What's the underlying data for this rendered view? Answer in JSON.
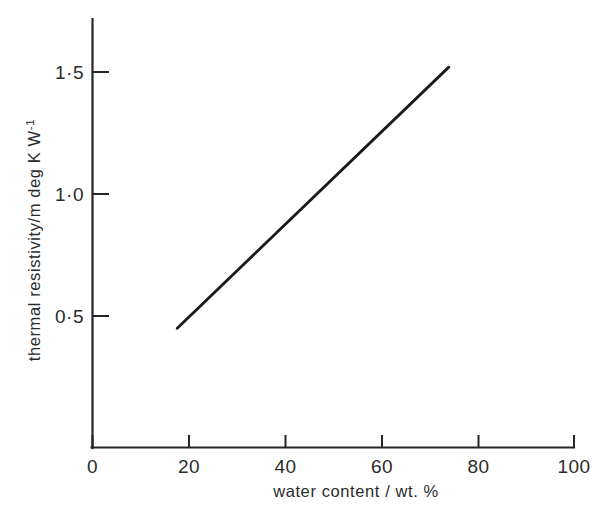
{
  "figure": {
    "background_color": "#ffffff",
    "ink_color": "#1a1a1a"
  },
  "chart_data": {
    "type": "line",
    "title": "",
    "subtitle": "",
    "xlabel": "water content / wt. %",
    "ylabel": "thermal resistivity/m deg K W",
    "ylabel_exponent": "-1",
    "xlim": [
      0,
      100
    ],
    "ylim": [
      0,
      1.6
    ],
    "x_ticks": [
      0,
      20,
      40,
      60,
      80,
      100
    ],
    "x_tick_labels": [
      "0",
      "20",
      "40",
      "60",
      "80",
      "100"
    ],
    "y_ticks": [
      0.5,
      1.0,
      1.5
    ],
    "y_tick_labels": [
      "0·5",
      "1·0",
      "1·5"
    ],
    "grid": false,
    "legend": null,
    "minor_ticks": false,
    "series": [
      {
        "name": "thermal resistivity vs water content",
        "style": "solid",
        "color": "#1a1a1a",
        "x": [
          17.6,
          74.0
        ],
        "y": [
          0.45,
          1.52
        ]
      }
    ],
    "annotations": []
  },
  "axis_labels": {
    "x_title": "water content / wt. %",
    "y_title_main": "thermal resistivity/m deg K  W",
    "y_title_sup": "-1"
  },
  "tick_text": {
    "x": [
      "0",
      "20",
      "40",
      "60",
      "80",
      "100"
    ],
    "y": [
      "0·5",
      "1·0",
      "1·5"
    ]
  }
}
